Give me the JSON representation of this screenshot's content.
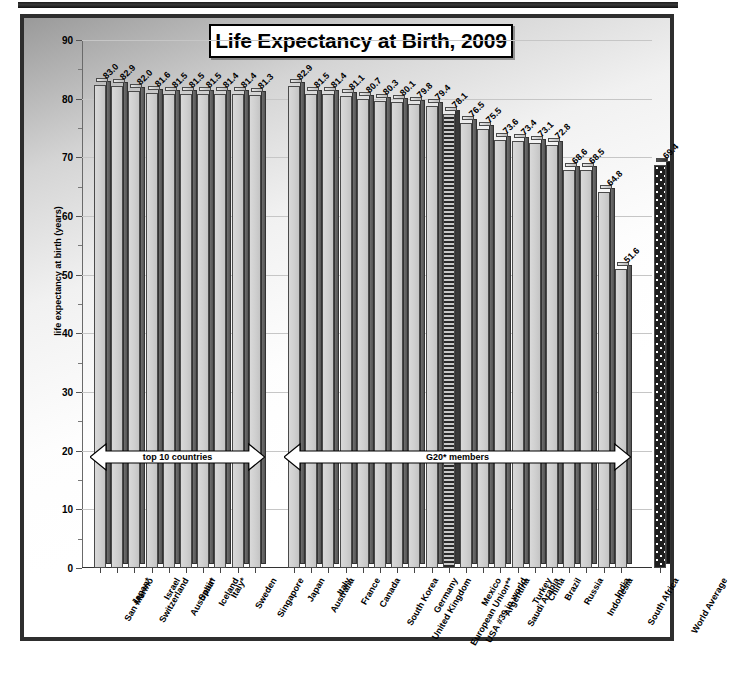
{
  "chart_data": {
    "type": "bar",
    "title": "Life Expectancy at Birth, 2009",
    "xlabel": "",
    "ylabel": "life expectancy at birth (years)",
    "ylim": [
      0,
      90
    ],
    "ytick_step": 10,
    "yticks": [
      0,
      10,
      20,
      30,
      40,
      50,
      60,
      70,
      80,
      90
    ],
    "grid": true,
    "legend": "none",
    "groups": [
      {
        "name": "top 10 countries",
        "annotation": "top 10 countries",
        "categories": [
          "San Marino",
          "Japan*",
          "Switzerland",
          "Israel",
          "Australia*",
          "Spain",
          "Iceland",
          "Italy*",
          "Sweden",
          "Singapore"
        ],
        "values": [
          83.0,
          82.9,
          82.0,
          81.6,
          81.5,
          81.5,
          81.5,
          81.4,
          81.4,
          81.3
        ]
      },
      {
        "name": "G20 members",
        "annotation": "G20* members",
        "categories": [
          "Japan",
          "Australia",
          "Italy",
          "France",
          "Canada",
          "South Korea",
          "United Kingdom",
          "Germany",
          "European Union**",
          "USA #39 in world",
          "Mexico",
          "Argentina",
          "Saudi Arabia",
          "Turkey",
          "China",
          "Brazil",
          "Russia",
          "Indonesia",
          "India",
          "South Africa"
        ],
        "values": [
          82.9,
          81.5,
          81.4,
          81.1,
          80.7,
          80.3,
          80.1,
          79.8,
          79.4,
          78.1,
          76.5,
          75.5,
          73.6,
          73.4,
          73.1,
          72.8,
          68.6,
          68.5,
          64.8,
          51.6
        ],
        "highlight": {
          "category": "USA #39 in world",
          "style": "hatched"
        }
      },
      {
        "name": "world",
        "annotation": "",
        "categories": [
          "World Average"
        ],
        "values": [
          69.4
        ],
        "highlight": {
          "category": "World Average",
          "style": "dotted-dark"
        }
      }
    ],
    "categories": [
      "San Marino",
      "Japan*",
      "Switzerland",
      "Israel",
      "Australia*",
      "Spain",
      "Iceland",
      "Italy*",
      "Sweden",
      "Singapore",
      "Japan",
      "Australia",
      "Italy",
      "France",
      "Canada",
      "South Korea",
      "United Kingdom",
      "Germany",
      "European Union**",
      "USA #39 in world",
      "Mexico",
      "Argentina",
      "Saudi Arabia",
      "Turkey",
      "China",
      "Brazil",
      "Russia",
      "Indonesia",
      "India",
      "South Africa",
      "World Average"
    ],
    "values": [
      83.0,
      82.9,
      82.0,
      81.6,
      81.5,
      81.5,
      81.5,
      81.4,
      81.4,
      81.3,
      82.9,
      81.5,
      81.4,
      81.1,
      80.7,
      80.3,
      80.1,
      79.8,
      79.4,
      78.1,
      76.5,
      75.5,
      73.6,
      73.4,
      73.1,
      72.8,
      68.6,
      68.5,
      64.8,
      51.6,
      69.4
    ],
    "value_labels": [
      "83.0",
      "82.9",
      "82.0",
      "81.6",
      "81.5",
      "81.5",
      "81.5",
      "81.4",
      "81.4",
      "81.3",
      "82.9",
      "81.5",
      "81.4",
      "81.1",
      "80.7",
      "80.3",
      "80.1",
      "79.8",
      "79.4",
      "78.1",
      "76.5",
      "75.5",
      "73.6",
      "73.4",
      "73.1",
      "72.8",
      "68.6",
      "68.5",
      "64.8",
      "51.6",
      "69.4"
    ],
    "ytick_labels": [
      "0",
      "10",
      "20",
      "30",
      "40",
      "50",
      "60",
      "70",
      "80",
      "90"
    ],
    "annotations": [
      {
        "text": "top 10 countries",
        "type": "double-arrow"
      },
      {
        "text": "G20* members",
        "type": "double-arrow"
      }
    ]
  },
  "colors": {
    "bar_face": "#cfcfcf",
    "bar_side": "#5c5c5c",
    "outline": "#4a4a4a",
    "frame": "#2e2e2e",
    "grid": "#c6c6c6",
    "text": "#000000",
    "highlight_usa": "#2a2a2a",
    "highlight_world": "#1e1e1e"
  }
}
